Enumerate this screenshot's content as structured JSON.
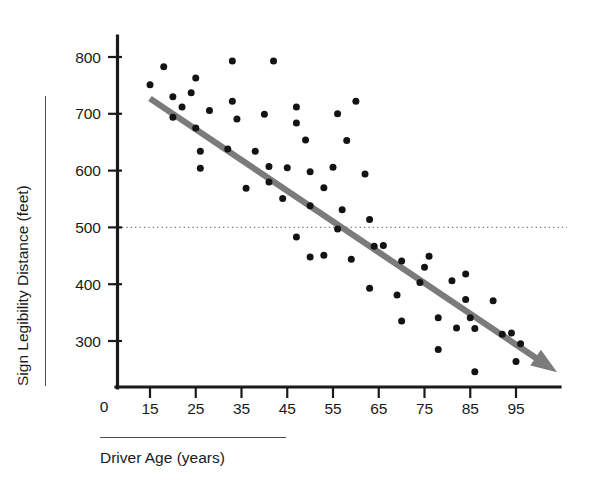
{
  "chart_data": {
    "type": "scatter",
    "title": "",
    "xlabel": "Driver Age (years)",
    "ylabel": "Sign Legibility Distance (feet)",
    "xlim": [
      8,
      108
    ],
    "ylim": [
      220,
      830
    ],
    "x_ticks": [
      15,
      25,
      35,
      45,
      55,
      65,
      75,
      85,
      95
    ],
    "y_ticks": [
      300,
      400,
      500,
      600,
      700,
      800
    ],
    "origin_label": "0",
    "grid": "horizontal dotted reference line at y = 500 only",
    "legend": "none",
    "reference_line": {
      "axis": "y",
      "value": 500,
      "style": "dotted",
      "color": "#767676"
    },
    "trend_line": {
      "style": "thick gray arrow",
      "color": "#7b7b7b",
      "direction": "negative",
      "start": {
        "x": 15,
        "y": 727
      },
      "end": {
        "x": 104,
        "y": 245
      },
      "arrowhead": "at right end"
    },
    "points": [
      {
        "x": 15,
        "y": 751
      },
      {
        "x": 18,
        "y": 783
      },
      {
        "x": 20,
        "y": 730
      },
      {
        "x": 20,
        "y": 694
      },
      {
        "x": 22,
        "y": 712
      },
      {
        "x": 24,
        "y": 737
      },
      {
        "x": 25,
        "y": 763
      },
      {
        "x": 25,
        "y": 675
      },
      {
        "x": 26,
        "y": 634
      },
      {
        "x": 26,
        "y": 604
      },
      {
        "x": 28,
        "y": 706
      },
      {
        "x": 32,
        "y": 638
      },
      {
        "x": 33,
        "y": 793
      },
      {
        "x": 33,
        "y": 722
      },
      {
        "x": 34,
        "y": 691
      },
      {
        "x": 36,
        "y": 569
      },
      {
        "x": 38,
        "y": 634
      },
      {
        "x": 40,
        "y": 699
      },
      {
        "x": 42,
        "y": 793
      },
      {
        "x": 41,
        "y": 607
      },
      {
        "x": 41,
        "y": 580
      },
      {
        "x": 44,
        "y": 551
      },
      {
        "x": 45,
        "y": 605
      },
      {
        "x": 47,
        "y": 712
      },
      {
        "x": 47,
        "y": 684
      },
      {
        "x": 47,
        "y": 483
      },
      {
        "x": 49,
        "y": 654
      },
      {
        "x": 50,
        "y": 598
      },
      {
        "x": 50,
        "y": 538
      },
      {
        "x": 50,
        "y": 448
      },
      {
        "x": 53,
        "y": 451
      },
      {
        "x": 53,
        "y": 570
      },
      {
        "x": 55,
        "y": 606
      },
      {
        "x": 56,
        "y": 700
      },
      {
        "x": 56,
        "y": 497
      },
      {
        "x": 57,
        "y": 531
      },
      {
        "x": 58,
        "y": 653
      },
      {
        "x": 59,
        "y": 444
      },
      {
        "x": 60,
        "y": 722
      },
      {
        "x": 62,
        "y": 594
      },
      {
        "x": 63,
        "y": 514
      },
      {
        "x": 63,
        "y": 393
      },
      {
        "x": 64,
        "y": 467
      },
      {
        "x": 66,
        "y": 468
      },
      {
        "x": 69,
        "y": 381
      },
      {
        "x": 70,
        "y": 441
      },
      {
        "x": 70,
        "y": 335
      },
      {
        "x": 74,
        "y": 403
      },
      {
        "x": 75,
        "y": 430
      },
      {
        "x": 76,
        "y": 449
      },
      {
        "x": 78,
        "y": 341
      },
      {
        "x": 78,
        "y": 285
      },
      {
        "x": 81,
        "y": 406
      },
      {
        "x": 82,
        "y": 323
      },
      {
        "x": 84,
        "y": 418
      },
      {
        "x": 84,
        "y": 373
      },
      {
        "x": 85,
        "y": 341
      },
      {
        "x": 86,
        "y": 322
      },
      {
        "x": 86,
        "y": 246
      },
      {
        "x": 90,
        "y": 371
      },
      {
        "x": 92,
        "y": 312
      },
      {
        "x": 94,
        "y": 314
      },
      {
        "x": 95,
        "y": 264
      },
      {
        "x": 96,
        "y": 295
      }
    ]
  },
  "axes": {
    "x_tick_labels": [
      "15",
      "25",
      "35",
      "45",
      "55",
      "65",
      "75",
      "85",
      "95"
    ],
    "y_tick_labels": [
      "300",
      "400",
      "500",
      "600",
      "700",
      "800"
    ],
    "origin": "0",
    "x_title": "Driver Age (years)",
    "y_title": "Sign Legibility Distance (feet)"
  },
  "colors": {
    "point": "#131313",
    "trend": "#7b7b7b",
    "axis": "#1a1a1a",
    "gridline": "#767676",
    "background": "#ffffff"
  }
}
